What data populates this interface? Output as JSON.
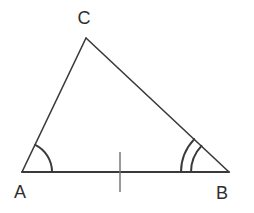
{
  "figure": {
    "kind": "geometry-diagram",
    "shape": "triangle",
    "background_color": "#ffffff",
    "stroke_color": "#3a3a3a",
    "label_color": "#2e2e2e",
    "stroke_width": 1.6,
    "canvas": {
      "width": 254,
      "height": 213
    }
  },
  "vertices": [
    {
      "id": "A",
      "label": "A",
      "x": 22,
      "y": 172,
      "label_x": 20,
      "label_y": 198
    },
    {
      "id": "B",
      "label": "B",
      "x": 229,
      "y": 172,
      "label_x": 222,
      "label_y": 199
    },
    {
      "id": "C",
      "label": "C",
      "x": 86,
      "y": 38,
      "label_x": 84,
      "label_y": 24
    }
  ],
  "sides": [
    {
      "id": "AB",
      "from": "A",
      "to": "B",
      "tick_marks": 1
    },
    {
      "id": "AC",
      "from": "A",
      "to": "C",
      "tick_marks": 0
    },
    {
      "id": "CB",
      "from": "C",
      "to": "B",
      "tick_marks": 0
    }
  ],
  "angle_marks": [
    {
      "at": "A",
      "arcs": 1,
      "radii": [
        30
      ]
    },
    {
      "at": "B",
      "arcs": 2,
      "radii": [
        38,
        48
      ]
    }
  ],
  "tick_marks": [
    {
      "on_side": "AB",
      "x": 120,
      "y_top": 152,
      "y_bottom": 192
    }
  ]
}
